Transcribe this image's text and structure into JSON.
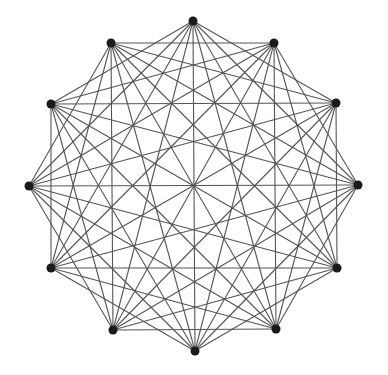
{
  "diagram": {
    "type": "graph",
    "node_color": "#1a1a1a",
    "edge_color": "#555555",
    "node_radius": 4.5,
    "min_skip": 2,
    "nodes": [
      {
        "id": 0,
        "x": 193,
        "y": 21
      },
      {
        "id": 1,
        "x": 274,
        "y": 43
      },
      {
        "id": 2,
        "x": 336,
        "y": 103
      },
      {
        "id": 3,
        "x": 358,
        "y": 185
      },
      {
        "id": 4,
        "x": 337,
        "y": 268
      },
      {
        "id": 5,
        "x": 276,
        "y": 329
      },
      {
        "id": 6,
        "x": 195,
        "y": 351
      },
      {
        "id": 7,
        "x": 113,
        "y": 330
      },
      {
        "id": 8,
        "x": 51,
        "y": 268
      },
      {
        "id": 9,
        "x": 29,
        "y": 186
      },
      {
        "id": 10,
        "x": 51,
        "y": 104
      },
      {
        "id": 11,
        "x": 111,
        "y": 43
      }
    ]
  }
}
